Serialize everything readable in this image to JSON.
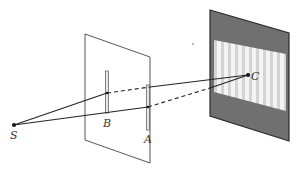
{
  "diagram": {
    "labels": {
      "source": "S",
      "slit_b": "B",
      "slit_a": "A",
      "screen_point": "C"
    },
    "colors": {
      "line": "#222222",
      "plane": "#444444",
      "screen_dark": "#6f6f6f",
      "screen_light": "#f2f2f2",
      "fringe": "#d6d6d6"
    }
  }
}
